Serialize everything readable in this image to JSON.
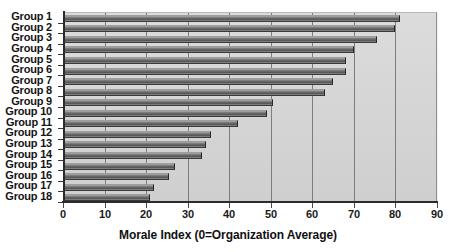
{
  "chart_data": {
    "type": "bar",
    "orientation": "horizontal",
    "title": "",
    "xlabel": "Morale Index (0=Organization Average)",
    "ylabel": "",
    "xlim": [
      0,
      90
    ],
    "ylim": null,
    "grid": true,
    "legend": false,
    "xticks": [
      0,
      10,
      20,
      30,
      40,
      50,
      60,
      70,
      80,
      90
    ],
    "categories": [
      "Group 1",
      "Group 2",
      "Group 3",
      "Group 4",
      "Group 5",
      "Group 6",
      "Group 7",
      "Group 8",
      "Group 9",
      "Group 10",
      "Group 11",
      "Group 12",
      "Group 13",
      "Group 14",
      "Group 15",
      "Group 16",
      "Group 17",
      "Group 18"
    ],
    "values": [
      81,
      80,
      75.5,
      70,
      68,
      68,
      65,
      63,
      50.5,
      49,
      42,
      35.5,
      34.5,
      33.5,
      27,
      25.5,
      22,
      21
    ],
    "series": [
      {
        "name": "Morale Index",
        "values": [
          81,
          80,
          75.5,
          70,
          68,
          68,
          65,
          63,
          50.5,
          49,
          42,
          35.5,
          34.5,
          33.5,
          27,
          25.5,
          22,
          21
        ]
      }
    ],
    "colors": {
      "bar_dark": "#585858",
      "bar_light": "#b4b4b4",
      "plot_background": "#d6d6d6",
      "gridline": "#7d7d7d",
      "axis": "#2b2b2b",
      "text": "#111111"
    }
  }
}
